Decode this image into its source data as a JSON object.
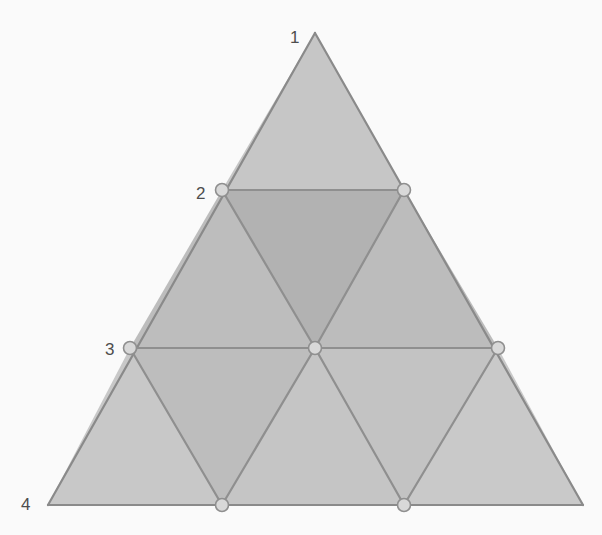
{
  "figure": {
    "background_color": "#fafafa",
    "width": 602,
    "height": 535
  },
  "geometry": {
    "apex": {
      "x": 315,
      "y": 33
    },
    "bottom_left": {
      "x": 48,
      "y": 505
    },
    "bottom_right": {
      "x": 583,
      "y": 505
    },
    "rows": 3,
    "triangle_count": 9,
    "points": {
      "p0_0": {
        "x": 315,
        "y": 33
      },
      "p1_0": {
        "x": 222,
        "y": 190
      },
      "p1_1": {
        "x": 404,
        "y": 190
      },
      "p2_0": {
        "x": 130,
        "y": 348
      },
      "p2_1": {
        "x": 315,
        "y": 348
      },
      "p2_2": {
        "x": 498,
        "y": 348
      },
      "p3_0": {
        "x": 48,
        "y": 505
      },
      "p3_1": {
        "x": 222,
        "y": 505
      },
      "p3_2": {
        "x": 404,
        "y": 505
      },
      "p3_3": {
        "x": 583,
        "y": 505
      }
    }
  },
  "style": {
    "edge_color": "#8f8f8f",
    "edge_color_outer": "#8a8a8a",
    "edge_width": 2.2,
    "node_fill": "#d8d8d8",
    "node_stroke": "#8f8f8f",
    "node_stroke_width": 1.6,
    "node_radius": 6.5,
    "label_color": "#4d4d4d",
    "label_font_size": 17
  },
  "faces": [
    {
      "id": "face-row1-up1",
      "orientation": "up",
      "row": 1,
      "fill": "#c6c6c6",
      "points": "315,33 222,190 404,190"
    },
    {
      "id": "face-row2-up1",
      "orientation": "up",
      "row": 2,
      "fill": "#bdbdbd",
      "points": "222,190 130,348 315,348"
    },
    {
      "id": "face-row2-down1",
      "orientation": "down",
      "row": 2,
      "fill": "#b2b2b2",
      "points": "222,190 404,190 315,348"
    },
    {
      "id": "face-row2-up2",
      "orientation": "up",
      "row": 2,
      "fill": "#bcbcbc",
      "points": "404,190 315,348 498,348"
    },
    {
      "id": "face-row3-up1",
      "orientation": "up",
      "row": 3,
      "fill": "#c8c8c8",
      "points": "130,348 48,505 222,505"
    },
    {
      "id": "face-row3-down1",
      "orientation": "down",
      "row": 3,
      "fill": "#bdbdbd",
      "points": "130,348 315,348 222,505"
    },
    {
      "id": "face-row3-up2",
      "orientation": "up",
      "row": 3,
      "fill": "#c5c5c5",
      "points": "315,348 222,505 404,505"
    },
    {
      "id": "face-row3-down2",
      "orientation": "down",
      "row": 3,
      "fill": "#c3c3c3",
      "points": "315,348 498,348 404,505"
    },
    {
      "id": "face-row3-up3",
      "orientation": "up",
      "row": 3,
      "fill": "#c9c9c9",
      "points": "498,348 404,505 583,505"
    }
  ],
  "edges": [
    {
      "id": "edge-outer-left",
      "kind": "outer",
      "x1": 315,
      "y1": 33,
      "x2": 48,
      "y2": 505
    },
    {
      "id": "edge-outer-right",
      "kind": "outer",
      "x1": 315,
      "y1": 33,
      "x2": 583,
      "y2": 505
    },
    {
      "id": "edge-outer-bottom",
      "kind": "outer",
      "x1": 48,
      "y1": 505,
      "x2": 583,
      "y2": 505
    },
    {
      "id": "edge-horizontal-row1",
      "kind": "inner",
      "x1": 222,
      "y1": 190,
      "x2": 404,
      "y2": 190
    },
    {
      "id": "edge-horizontal-row2",
      "kind": "inner",
      "x1": 130,
      "y1": 348,
      "x2": 498,
      "y2": 348
    },
    {
      "id": "edge-diag-right-a",
      "kind": "inner",
      "x1": 222,
      "y1": 190,
      "x2": 315,
      "y2": 348
    },
    {
      "id": "edge-diag-right-b",
      "kind": "inner",
      "x1": 130,
      "y1": 348,
      "x2": 222,
      "y2": 505
    },
    {
      "id": "edge-diag-right-c",
      "kind": "inner",
      "x1": 315,
      "y1": 348,
      "x2": 404,
      "y2": 505
    },
    {
      "id": "edge-diag-left-a",
      "kind": "inner",
      "x1": 404,
      "y1": 190,
      "x2": 315,
      "y2": 348
    },
    {
      "id": "edge-diag-left-b",
      "kind": "inner",
      "x1": 498,
      "y1": 348,
      "x2": 404,
      "y2": 505
    },
    {
      "id": "edge-diag-left-c",
      "kind": "inner",
      "x1": 315,
      "y1": 348,
      "x2": 222,
      "y2": 505
    }
  ],
  "nodes": [
    {
      "id": "node-row1-left",
      "x": 222,
      "y": 190
    },
    {
      "id": "node-row1-right",
      "x": 404,
      "y": 190
    },
    {
      "id": "node-row2-left",
      "x": 130,
      "y": 348
    },
    {
      "id": "node-row2-center",
      "x": 315,
      "y": 348
    },
    {
      "id": "node-row2-right",
      "x": 498,
      "y": 348
    },
    {
      "id": "node-row3-left",
      "x": 222,
      "y": 505
    },
    {
      "id": "node-row3-right",
      "x": 404,
      "y": 505
    }
  ],
  "labels": [
    {
      "id": "label-1",
      "text": "1",
      "x": 290,
      "y": 29,
      "anchor": "right"
    },
    {
      "id": "label-2",
      "text": "2",
      "x": 196,
      "y": 185,
      "anchor": "right"
    },
    {
      "id": "label-3",
      "text": "3",
      "x": 105,
      "y": 341,
      "anchor": "right"
    },
    {
      "id": "label-4",
      "text": "4",
      "x": 21,
      "y": 496,
      "anchor": "right"
    }
  ]
}
